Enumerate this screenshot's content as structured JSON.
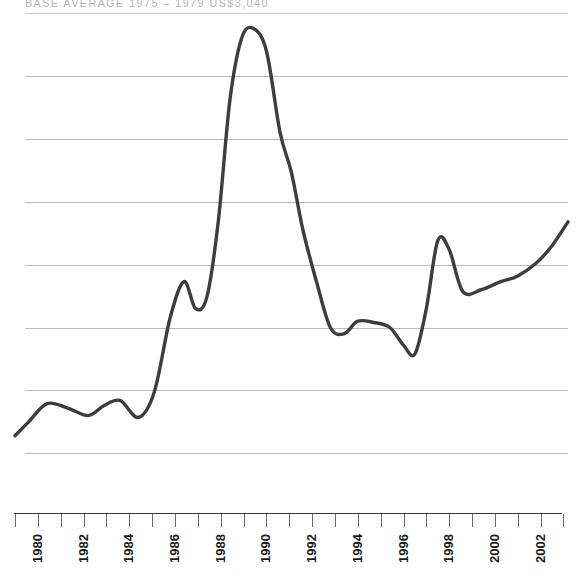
{
  "header": {
    "text": "BASE AVERAGE 1975 – 1979 US$3,040",
    "color": "#b4b4b4"
  },
  "axis": {
    "tick_years": [
      1979,
      1980,
      1981,
      1982,
      1983,
      1984,
      1985,
      1986,
      1987,
      1988,
      1989,
      1990,
      1991,
      1992,
      1993,
      1994,
      1995,
      1996,
      1997,
      1998,
      1999,
      2000,
      2001,
      2002,
      2003
    ],
    "labels": [
      "1980",
      "1982",
      "1984",
      "1986",
      "1988",
      "1990",
      "1992",
      "1994",
      "1996",
      "1998",
      "2000",
      "2002"
    ],
    "label_years": [
      1980,
      1982,
      1984,
      1986,
      1988,
      1990,
      1992,
      1994,
      1996,
      1998,
      2000,
      2002
    ]
  },
  "style": {
    "line_color": "#3d3d3d",
    "grid_color": "#b9b9b9",
    "axis_color": "#3a3a3a",
    "background": "#ffffff"
  },
  "chart_data": {
    "type": "line",
    "title": "BASE AVERAGE 1975 – 1979 US$3,040",
    "subtitle": "",
    "xlabel": "",
    "ylabel": "",
    "grid": true,
    "legend": false,
    "xlim": [
      1979,
      2003.2
    ],
    "ylim": [
      0,
      800
    ],
    "y_gridlines": [
      100,
      200,
      300,
      400,
      500,
      600,
      700,
      800
    ],
    "series": [
      {
        "name": "Index (base 1975–1979 = 100)",
        "x": [
          1979.0,
          1979.6,
          1980.4,
          1981.3,
          1982.2,
          1982.9,
          1983.6,
          1984.4,
          1985.1,
          1985.8,
          1986.4,
          1986.9,
          1987.4,
          1987.9,
          1988.4,
          1988.9,
          1989.4,
          1990.0,
          1990.6,
          1991.1,
          1991.6,
          1992.2,
          1992.8,
          1993.4,
          1994.0,
          1994.7,
          1995.4,
          1996.0,
          1996.5,
          1997.0,
          1997.5,
          1998.0,
          1998.6,
          1999.4,
          2000.2,
          2001.0,
          2001.8,
          2002.5,
          2003.2
        ],
        "y": [
          128,
          150,
          179,
          172,
          160,
          176,
          184,
          157,
          198,
          317,
          373,
          330,
          349,
          470,
          660,
          758,
          776,
          740,
          610,
          546,
          455,
          372,
          300,
          290,
          310,
          308,
          300,
          272,
          258,
          330,
          438,
          424,
          357,
          360,
          372,
          382,
          402,
          430,
          468
        ]
      }
    ]
  }
}
